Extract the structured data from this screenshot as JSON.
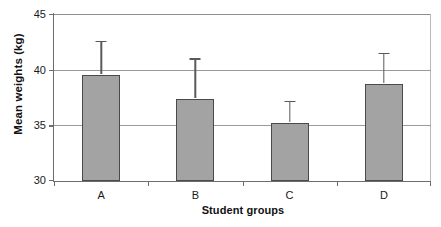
{
  "chart_data": {
    "type": "bar",
    "title": "",
    "xlabel": "Student groups",
    "ylabel": "Mean weights (kg)",
    "categories": [
      "A",
      "B",
      "C",
      "D"
    ],
    "values": [
      39.5,
      37.4,
      35.2,
      38.7
    ],
    "error_upper": [
      42.4,
      40.8,
      37.0,
      41.3
    ],
    "series": [
      {
        "name": "Mean weights",
        "values": [
          39.5,
          37.4,
          35.2,
          38.7
        ],
        "error_upper": [
          42.4,
          40.8,
          37.0,
          41.3
        ]
      }
    ],
    "ylim": [
      30,
      45
    ],
    "yticks": [
      30,
      35,
      40,
      45
    ],
    "ytick_labels": [
      "30",
      "35",
      "40",
      "45"
    ],
    "grid": true,
    "grid_axis": "y",
    "legend": false,
    "legend_position": "none",
    "bar_color": "#a3a3a3",
    "bar_edge_color": "#4a4a4a",
    "error_bar_color": "#5a5a5a",
    "error_bar_style": "upper-only-with-cap",
    "background_color": "#ffffff"
  }
}
